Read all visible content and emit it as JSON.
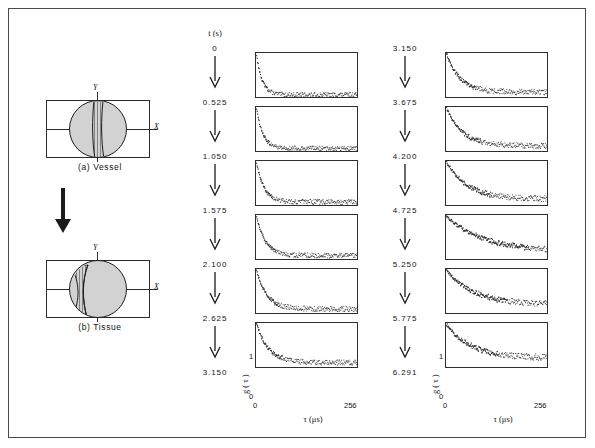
{
  "figure": {
    "schematics": [
      {
        "id": "vessel",
        "caption": "(a) Vessel",
        "x_label": "X",
        "y_label": "Y"
      },
      {
        "id": "tissue",
        "caption": "(b) Tissue",
        "x_label": "X",
        "y_label": "Y"
      }
    ],
    "transition_arrow": "down-arrow",
    "time_axis_header": "t (s)",
    "time_column_left": [
      "0",
      "0.525",
      "1.050",
      "1.575",
      "2.100",
      "2.625",
      "3.150"
    ],
    "time_column_right": [
      "3.150",
      "3.675",
      "4.200",
      "4.725",
      "5.250",
      "5.775",
      "6.291"
    ],
    "y_axis_label": "g ( τ )",
    "y_tick_top": "1",
    "y_tick_bottom": "0",
    "x_axis_label": "τ (μs)",
    "x_tick_left": "0",
    "x_tick_right": "256"
  },
  "chart_data": {
    "type": "scatter",
    "title": "",
    "subtitle": "",
    "xlabel": "τ (μs)",
    "ylabel": "g ( τ )",
    "xlim": [
      0,
      256
    ],
    "ylim": [
      0,
      1
    ],
    "xticks": [
      0,
      256
    ],
    "yticks": [
      0,
      1
    ],
    "grid": false,
    "legend": null,
    "panel_rows": 6,
    "panel_cols": 2,
    "note": "Each panel is a photon correlation function g(tau) sampled as noisy dots; decay time constant increases with elapsed time t.",
    "panels": [
      {
        "column": "left",
        "row": 1,
        "t_start": "0",
        "t_end": "0.525",
        "decay_tau_us": 14,
        "baseline": 0.06,
        "amplitude": 0.94,
        "noise": 0.035
      },
      {
        "column": "left",
        "row": 2,
        "t_start": "0.525",
        "t_end": "1.050",
        "decay_tau_us": 16,
        "baseline": 0.07,
        "amplitude": 0.93,
        "noise": 0.035
      },
      {
        "column": "left",
        "row": 3,
        "t_start": "1.050",
        "t_end": "1.575",
        "decay_tau_us": 19,
        "baseline": 0.08,
        "amplitude": 0.92,
        "noise": 0.038
      },
      {
        "column": "left",
        "row": 4,
        "t_start": "1.575",
        "t_end": "2.100",
        "decay_tau_us": 22,
        "baseline": 0.09,
        "amplitude": 0.91,
        "noise": 0.04
      },
      {
        "column": "left",
        "row": 5,
        "t_start": "2.100",
        "t_end": "2.625",
        "decay_tau_us": 26,
        "baseline": 0.1,
        "amplitude": 0.9,
        "noise": 0.042
      },
      {
        "column": "left",
        "row": 6,
        "t_start": "2.625",
        "t_end": "3.150",
        "decay_tau_us": 30,
        "baseline": 0.11,
        "amplitude": 0.89,
        "noise": 0.042
      },
      {
        "column": "right",
        "row": 1,
        "t_start": "3.150",
        "t_end": "3.675",
        "decay_tau_us": 34,
        "baseline": 0.12,
        "amplitude": 0.88,
        "noise": 0.045
      },
      {
        "column": "right",
        "row": 2,
        "t_start": "3.675",
        "t_end": "4.200",
        "decay_tau_us": 40,
        "baseline": 0.13,
        "amplitude": 0.87,
        "noise": 0.045
      },
      {
        "column": "right",
        "row": 3,
        "t_start": "4.200",
        "t_end": "4.725",
        "decay_tau_us": 52,
        "baseline": 0.15,
        "amplitude": 0.85,
        "noise": 0.048
      },
      {
        "column": "right",
        "row": 4,
        "t_start": "4.725",
        "t_end": "5.250",
        "decay_tau_us": 95,
        "baseline": 0.18,
        "amplitude": 0.8,
        "noise": 0.05
      },
      {
        "column": "right",
        "row": 5,
        "t_start": "5.250",
        "t_end": "5.775",
        "decay_tau_us": 70,
        "baseline": 0.2,
        "amplitude": 0.78,
        "noise": 0.052
      },
      {
        "column": "right",
        "row": 6,
        "t_start": "5.775",
        "t_end": "6.291",
        "decay_tau_us": 60,
        "baseline": 0.22,
        "amplitude": 0.76,
        "noise": 0.052
      }
    ]
  },
  "colors": {
    "frame": "#4a4a4a",
    "ink": "#1a1a1a",
    "panel_border": "#2e2e2e",
    "dot": "#2a2a2a",
    "circle_fill": "#d2d2d2"
  }
}
